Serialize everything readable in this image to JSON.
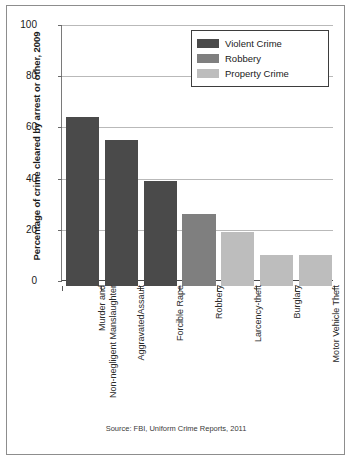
{
  "chart_data": {
    "type": "bar",
    "title": "",
    "xlabel": "",
    "ylabel": "Percentage of crime cleared by arrest or other, 2009",
    "ylim": [
      0,
      100
    ],
    "yticks": [
      0,
      20,
      40,
      60,
      80,
      100
    ],
    "grid": true,
    "categories": [
      "Murder and\nNon-negligent Manslaughter",
      "AggravatedAssault",
      "Forcible Rape",
      "Robbery",
      "Larcency-theft",
      "Burglary",
      "Motor Vehicle Theft"
    ],
    "values": [
      66,
      57,
      41,
      28,
      21,
      12,
      12
    ],
    "bar_groups": [
      "violent",
      "violent",
      "violent",
      "robbery",
      "property",
      "property",
      "property"
    ],
    "legend": {
      "position": "top-right",
      "entries": [
        {
          "label": "Violent Crime",
          "key": "violent",
          "color": "#4a4a4a"
        },
        {
          "label": "Robbery",
          "key": "robbery",
          "color": "#7f7f7f"
        },
        {
          "label": "Property Crime",
          "key": "property",
          "color": "#bdbdbd"
        }
      ]
    },
    "source": "Source: FBI, Uniform Crime Reports, 2011"
  },
  "colors": {
    "violent": "#4a4a4a",
    "robbery": "#7f7f7f",
    "property": "#bdbdbd",
    "gridline": "#b9b9b9",
    "axis": "#4a4a4a",
    "frame": "#8d8d8d",
    "text": "#1a1a1a"
  }
}
